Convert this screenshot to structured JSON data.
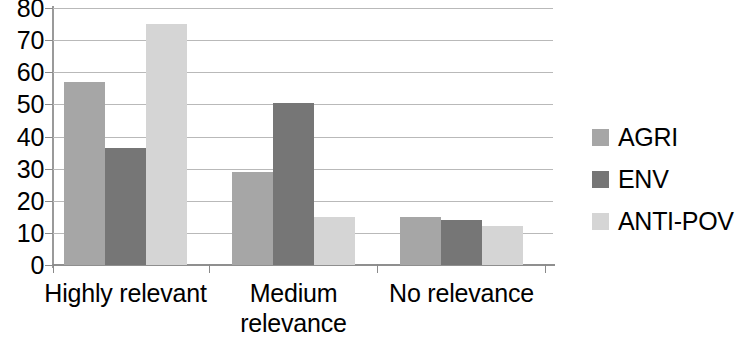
{
  "chart_data": {
    "type": "bar",
    "title": "",
    "subtitle": "",
    "xlabel": "",
    "ylabel": "",
    "categories": [
      "Highly relevant",
      "Medium relevance",
      "No relevance"
    ],
    "series": [
      {
        "name": "AGRI",
        "color": "#a6a6a6",
        "values": [
          57,
          29,
          15
        ]
      },
      {
        "name": "ENV",
        "color": "#767676",
        "values": [
          36.5,
          50.5,
          14
        ]
      },
      {
        "name": "ANTI-POV",
        "color": "#d5d5d5",
        "values": [
          75,
          15,
          12
        ]
      }
    ],
    "ylim": [
      0,
      80
    ],
    "y_ticks": [
      80,
      70,
      60,
      50,
      40,
      30,
      20,
      10,
      0
    ],
    "y_tick_labels": [
      "80",
      "70",
      "60",
      "50",
      "40",
      "30",
      "20",
      "10",
      "0"
    ],
    "grid": true,
    "grid_axis": "y",
    "legend_position": "right",
    "legend_entries": [
      "AGRI",
      "ENV",
      "ANTI-POV"
    ]
  },
  "axis": {
    "y_tick_labels": [
      "80",
      "70",
      "60",
      "50",
      "40",
      "30",
      "20",
      "10",
      "0"
    ],
    "x_category_labels": [
      "Highly relevant",
      "Medium\nrelevance",
      "No relevance"
    ]
  },
  "legend": {
    "items": [
      {
        "label": "AGRI",
        "color": "#a6a6a6"
      },
      {
        "label": "ENV",
        "color": "#767676"
      },
      {
        "label": "ANTI-POV",
        "color": "#d5d5d5"
      }
    ]
  },
  "colors": {
    "agri": "#a6a6a6",
    "env": "#767676",
    "anti_pov": "#d5d5d5",
    "gridline": "#b9b9b9",
    "axis": "#8f8f8f",
    "text": "#000000",
    "background": "#ffffff"
  }
}
